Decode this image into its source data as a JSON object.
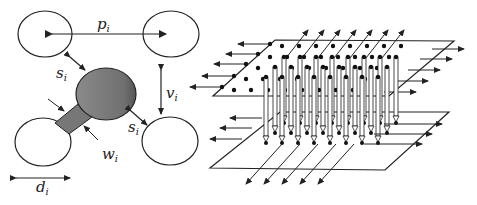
{
  "figure": {
    "left_panel": {
      "description": "Via pad geometry between four neighboring vias",
      "labels": {
        "pitch": {
          "base": "p",
          "sub": "i"
        },
        "spacing_top": {
          "base": "s",
          "sub": "i"
        },
        "spacing_bottom": {
          "base": "s",
          "sub": "i"
        },
        "vertical_pitch": {
          "base": "v",
          "sub": "i"
        },
        "width": {
          "base": "w",
          "sub": "i"
        },
        "diameter": {
          "base": "d",
          "sub": "i"
        }
      },
      "colors": {
        "pad_fill": "#7a7a7a",
        "stroke": "#222222"
      }
    },
    "right_panel": {
      "description": "Two parallel planes with vertical vias connecting grid of dots, with fanout arrows",
      "top_plane_rows": 5,
      "via_columns": 8,
      "colors": {
        "stroke": "#222222",
        "dot": "#111111"
      }
    }
  }
}
